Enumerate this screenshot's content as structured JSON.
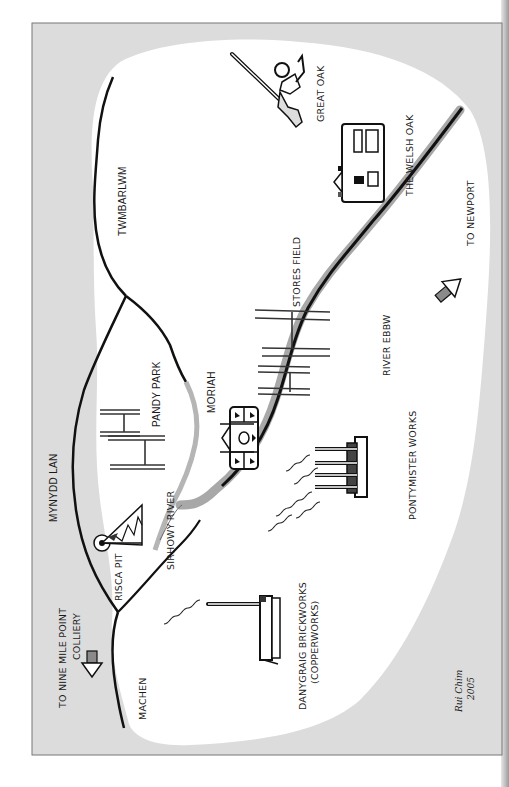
{
  "map": {
    "title": "",
    "orientation": "rotated-90-ccw",
    "colors": {
      "frame_fill": "#dcdcdc",
      "land_fill": "#ffffff",
      "ink": "#111111",
      "river_grey": "#a8a8a8",
      "arrow_fill": "#8a8a8a",
      "frame_border": "#777777"
    },
    "labels": {
      "great_oak": "GREAT OAK",
      "welsh_oak": "THE WELSH OAK",
      "twmbarlwm": "TWMBARLWM",
      "to_newport": "TO NEWPORT",
      "stores_field": "STORES FIELD",
      "river_ebbw": "RIVER EBBW",
      "pandy_park": "PANDY PARK",
      "moriah": "MORIAH",
      "mynydd_lan": "MYNYDD LAN",
      "pontymister_works": "PONTYMISTER WORKS",
      "sirhowy_river": "SIRHOWY RIVER",
      "risca_pit": "RISCA PIT",
      "to_nine_mile_point_line1": "TO NINE MILE POINT",
      "to_nine_mile_point_line2": "COLLIERY",
      "danygraig_line1": "DANYGRAIG BRICKWORKS",
      "danygraig_line2": "(COPPERWORKS)",
      "machen": "MACHEN"
    },
    "signature": {
      "name": "Rui Chim",
      "year": "2005"
    },
    "landmarks": [
      {
        "id": "great-oak",
        "icon": "tree-icon"
      },
      {
        "id": "welsh-oak",
        "icon": "pub-building-icon"
      },
      {
        "id": "to-newport",
        "icon": "arrow-icon"
      },
      {
        "id": "stores-field",
        "icon": "rugby-posts-icon"
      },
      {
        "id": "pandy-park",
        "icon": "rugby-posts-icon"
      },
      {
        "id": "moriah",
        "icon": "chapel-icon"
      },
      {
        "id": "pontymister-works",
        "icon": "factory-chimneys-icon"
      },
      {
        "id": "risca-pit",
        "icon": "pithead-winding-gear-icon"
      },
      {
        "id": "danygraig-brickworks",
        "icon": "chimney-kiln-icon"
      },
      {
        "id": "to-nine-mile-point",
        "icon": "arrow-icon"
      }
    ]
  }
}
